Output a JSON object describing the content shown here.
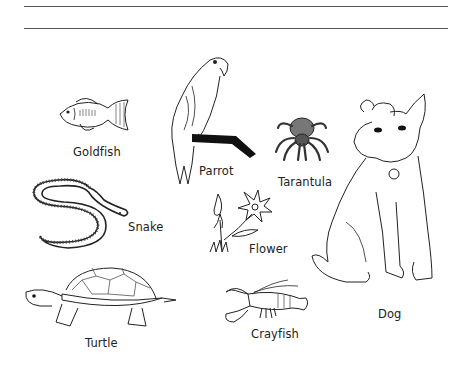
{
  "worksheet": {
    "answer_lines": 2,
    "items": [
      {
        "id": "goldfish",
        "label": "Goldfish"
      },
      {
        "id": "parrot",
        "label": "Parrot"
      },
      {
        "id": "tarantula",
        "label": "Tarantula"
      },
      {
        "id": "dog",
        "label": "Dog"
      },
      {
        "id": "snake",
        "label": "Snake"
      },
      {
        "id": "flower",
        "label": "Flower"
      },
      {
        "id": "turtle",
        "label": "Turtle"
      },
      {
        "id": "crayfish",
        "label": "Crayfish"
      }
    ]
  }
}
